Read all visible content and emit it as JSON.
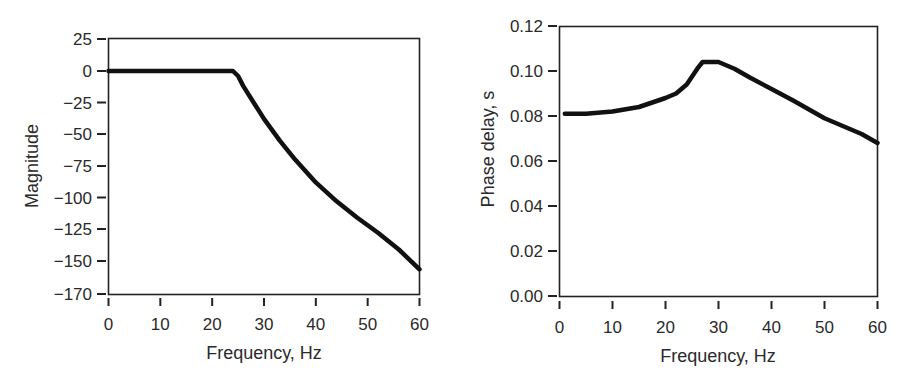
{
  "chart_data": [
    {
      "type": "line",
      "title": "",
      "xlabel": "Frequency, Hz",
      "ylabel": "Magnitude",
      "xlim": [
        0,
        60
      ],
      "ylim": [
        -170,
        25
      ],
      "grid": false,
      "legend": null,
      "x_ticks": [
        0,
        10,
        20,
        30,
        40,
        50,
        60
      ],
      "y_ticks": [
        25,
        0,
        -25,
        -50,
        -75,
        -100,
        -125,
        -150,
        -170
      ],
      "y_tick_labels": [
        "25",
        "0",
        "−25",
        "−50",
        "−75",
        "−100",
        "−125",
        "−150",
        "−170"
      ],
      "series": [
        {
          "name": "Magnitude",
          "color": "#111111",
          "x": [
            0,
            5,
            10,
            15,
            20,
            24,
            25,
            26,
            28,
            30,
            33,
            36,
            40,
            44,
            48,
            52,
            56,
            60
          ],
          "y": [
            0,
            0,
            0,
            0,
            0,
            0,
            -4,
            -12,
            -25,
            -38,
            -55,
            -70,
            -88,
            -103,
            -116,
            -128,
            -141,
            -155
          ]
        }
      ]
    },
    {
      "type": "line",
      "title": "",
      "xlabel": "Frequency, Hz",
      "ylabel": "Phase delay, s",
      "xlim": [
        0,
        60
      ],
      "ylim": [
        0.0,
        0.12
      ],
      "grid": false,
      "legend": null,
      "x_ticks": [
        0,
        10,
        20,
        30,
        40,
        50,
        60
      ],
      "y_ticks": [
        0.12,
        0.1,
        0.08,
        0.06,
        0.04,
        0.02,
        0.0
      ],
      "y_tick_labels": [
        "0.12",
        "0.10",
        "0.08",
        "0.06",
        "0.04",
        "0.02",
        "0.00"
      ],
      "series": [
        {
          "name": "Phase delay",
          "color": "#111111",
          "x": [
            1,
            5,
            10,
            15,
            20,
            22,
            24,
            26,
            27,
            28,
            30,
            33,
            36,
            40,
            44,
            47,
            50,
            54,
            57,
            60
          ],
          "y": [
            0.081,
            0.081,
            0.082,
            0.084,
            0.088,
            0.09,
            0.094,
            0.101,
            0.104,
            0.104,
            0.104,
            0.101,
            0.097,
            0.092,
            0.087,
            0.083,
            0.079,
            0.075,
            0.072,
            0.068
          ]
        }
      ]
    }
  ],
  "charts": {
    "left": {
      "xlabel": "Frequency, Hz",
      "ylabel": "Magnitude"
    },
    "right": {
      "xlabel": "Frequency, Hz",
      "ylabel": "Phase delay, s"
    }
  }
}
